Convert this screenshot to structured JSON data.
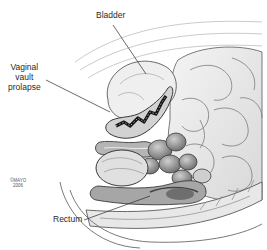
{
  "figure": {
    "type": "anatomical-illustration",
    "labels": {
      "bladder": "Bladder",
      "vaginal_vault_prolapse": [
        "Vaginal",
        "vault",
        "prolapse"
      ],
      "rectum": "Rectum"
    },
    "copyright": [
      "©MAYO",
      "2006"
    ],
    "colors": {
      "background": "#ffffff",
      "outline": "#4a4a4a",
      "tissue_light": "#e6e6e6",
      "tissue_mid": "#bdbdbd",
      "tissue_dark": "#555555",
      "cavity": "#141414",
      "label_text": "#2a2a2a"
    }
  }
}
